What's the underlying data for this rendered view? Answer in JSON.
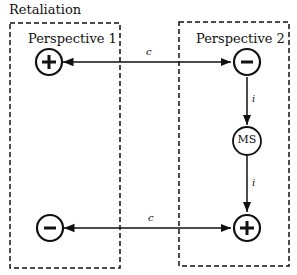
{
  "diagram": {
    "title": "Retaliation",
    "groups": [
      {
        "id": "p1",
        "label": "Perspective 1"
      },
      {
        "id": "p2",
        "label": "Perspective 2"
      }
    ],
    "nodes": [
      {
        "id": "p1_top",
        "group": "p1",
        "symbol": "+"
      },
      {
        "id": "p1_bottom",
        "group": "p1",
        "symbol": "−"
      },
      {
        "id": "p2_top",
        "group": "p2",
        "symbol": "−"
      },
      {
        "id": "p2_ms",
        "group": "p2",
        "symbol": "MS"
      },
      {
        "id": "p2_bottom",
        "group": "p2",
        "symbol": "+"
      }
    ],
    "edges": [
      {
        "from": "p1_top",
        "to": "p2_top",
        "label": "c",
        "bidirectional": true
      },
      {
        "from": "p2_top",
        "to": "p2_ms",
        "label": "i",
        "bidirectional": false
      },
      {
        "from": "p2_ms",
        "to": "p2_bottom",
        "label": "i",
        "bidirectional": false
      },
      {
        "from": "p1_bottom",
        "to": "p2_bottom",
        "label": "c",
        "bidirectional": true
      }
    ]
  }
}
